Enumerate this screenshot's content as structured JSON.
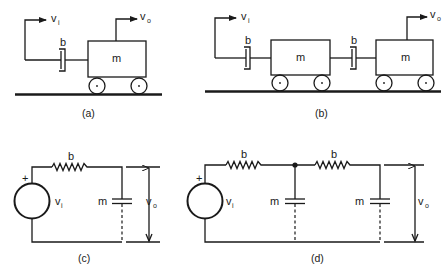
{
  "panels": {
    "a": {
      "caption": "(a)",
      "input": {
        "symbol": "v",
        "subscript": "i"
      },
      "output": {
        "symbol": "v",
        "subscript": "o"
      },
      "damper_label": "b",
      "mass_label": "m"
    },
    "b": {
      "caption": "(b)",
      "input": {
        "symbol": "v",
        "subscript": "i"
      },
      "output": {
        "symbol": "v",
        "subscript": "o"
      },
      "damper1_label": "b",
      "damper2_label": "b",
      "mass1_label": "m",
      "mass2_label": "m"
    },
    "c": {
      "caption": "(c)",
      "source": {
        "polarity": "+",
        "symbol": "v",
        "subscript": "i"
      },
      "resistor_label": "b",
      "capacitor_label": "m",
      "output": {
        "symbol": "v",
        "subscript": "o"
      }
    },
    "d": {
      "caption": "(d)",
      "source": {
        "polarity": "+",
        "symbol": "v",
        "subscript": "i"
      },
      "resistor1_label": "b",
      "resistor2_label": "b",
      "capacitor1_label": "m",
      "capacitor2_label": "m",
      "output": {
        "symbol": "v",
        "subscript": "o"
      }
    }
  }
}
